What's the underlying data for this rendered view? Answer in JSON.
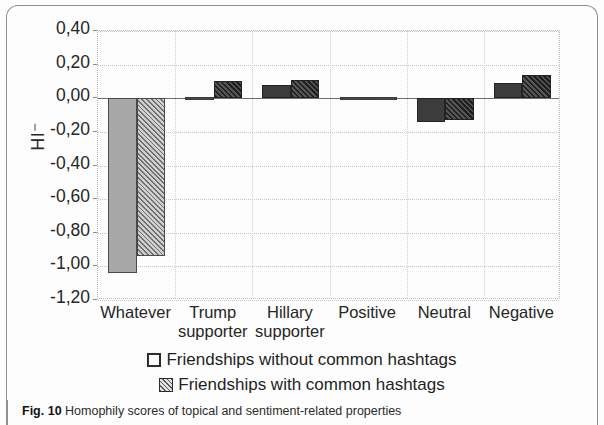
{
  "chart_data": {
    "type": "bar",
    "title": "",
    "xlabel": "",
    "ylabel": "HI⁻",
    "ylim": [
      -1.2,
      0.4
    ],
    "ytick_labels": [
      "0,40",
      "0,20",
      "0,00",
      "-0,20",
      "-0,40",
      "-0,60",
      "-0,80",
      "-1,00",
      "-1,20"
    ],
    "ytick_values": [
      0.4,
      0.2,
      0.0,
      -0.2,
      -0.4,
      -0.6,
      -0.8,
      -1.0,
      -1.2
    ],
    "grid": true,
    "legend_position": "below",
    "decimal_separator": ",",
    "categories": [
      "Whatever",
      "Trump supporter",
      "Hillary supporter",
      "Positive",
      "Neutral",
      "Negative"
    ],
    "category_lines": [
      [
        "Whatever",
        ""
      ],
      [
        "Trump",
        "supporter"
      ],
      [
        "Hillary",
        "supporter"
      ],
      [
        "Positive",
        ""
      ],
      [
        "Neutral",
        ""
      ],
      [
        "Negative",
        ""
      ]
    ],
    "series": [
      {
        "name": "Friendships without common hashtags",
        "values": [
          -1.04,
          0.01,
          0.08,
          0.0,
          -0.14,
          0.09
        ]
      },
      {
        "name": "Friendships with common hashtags",
        "values": [
          -0.94,
          0.1,
          0.11,
          0.0,
          -0.13,
          0.14
        ]
      }
    ]
  },
  "axis": {
    "ylabel": "HI⁻",
    "ytick_labels": [
      "0,40",
      "0,20",
      "0,00",
      "-0,20",
      "-0,40",
      "-0,60",
      "-0,80",
      "-1,00",
      "-1,20"
    ]
  },
  "xaxis": {
    "labels": [
      {
        "line1": "Whatever",
        "line2": ""
      },
      {
        "line1": "Trump",
        "line2": "supporter"
      },
      {
        "line1": "Hillary",
        "line2": "supporter"
      },
      {
        "line1": "Positive",
        "line2": ""
      },
      {
        "line1": "Neutral",
        "line2": ""
      },
      {
        "line1": "Negative",
        "line2": ""
      }
    ]
  },
  "legend": {
    "entries": [
      {
        "marker": "open-square",
        "label": "Friendships without common hashtags"
      },
      {
        "marker": "hatched-square",
        "label": "Friendships with common hashtags"
      }
    ]
  },
  "caption": {
    "figure_number": "Fig. 10",
    "text": "Homophily scores of topical and sentiment-related properties"
  },
  "colors": {
    "series1_fill": "#a7a7a7",
    "series2_fill": "#6f6f6f",
    "bar_outline": "#4a4a4a",
    "grid": "#c4c4c4",
    "axis": "#6e6e6e",
    "text": "#262626",
    "frame": "#8f8f8f"
  }
}
